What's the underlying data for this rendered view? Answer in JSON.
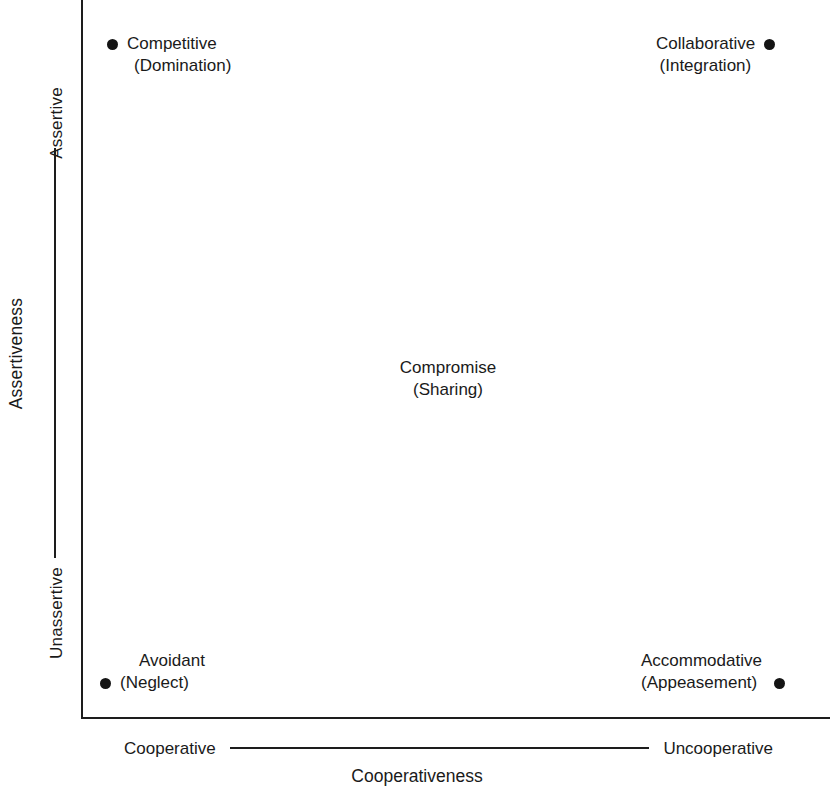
{
  "figure": {
    "background": "#ffffff",
    "ink_color": "#1a1a1a",
    "marker_color": "#141414"
  },
  "axes": {
    "y": {
      "title": "Assertiveness",
      "high_label": "Assertive",
      "low_label": "Unassertive"
    },
    "x": {
      "title": "Cooperativeness",
      "left_label": "Cooperative",
      "right_label": "Uncooperative"
    }
  },
  "chart_data": {
    "type": "scatter",
    "title": "",
    "xlabel": "Cooperativeness",
    "ylabel": "Assertiveness",
    "xlim": [
      0,
      1
    ],
    "ylim": [
      0,
      1
    ],
    "x_tick_labels": [
      "Cooperative",
      "Uncooperative"
    ],
    "y_tick_labels": [
      "Unassertive",
      "Assertive"
    ],
    "grid": false,
    "legend": "none",
    "points": [
      {
        "name": "Competitive",
        "label_line1": "Competitive",
        "label_line2": "(Domination)",
        "x": 0.04,
        "y": 0.96,
        "label_position": "right-of-marker"
      },
      {
        "name": "Collaborative",
        "label_line1": "Collaborative",
        "label_line2": "(Integration)",
        "x": 0.94,
        "y": 0.96,
        "label_position": "left-of-marker"
      },
      {
        "name": "Compromise",
        "label_line1": "Compromise",
        "label_line2": "(Sharing)",
        "x": 0.49,
        "y": 0.5,
        "label_position": "below-marker"
      },
      {
        "name": "Avoidant",
        "label_line1": "Avoidant",
        "label_line2": "(Neglect)",
        "x": 0.03,
        "y": 0.05,
        "label_position": "right-of-marker"
      },
      {
        "name": "Accommodative",
        "label_line1": "Accommodative",
        "label_line2": "(Appeasement)",
        "x": 0.94,
        "y": 0.05,
        "label_position": "left-of-marker"
      }
    ]
  }
}
